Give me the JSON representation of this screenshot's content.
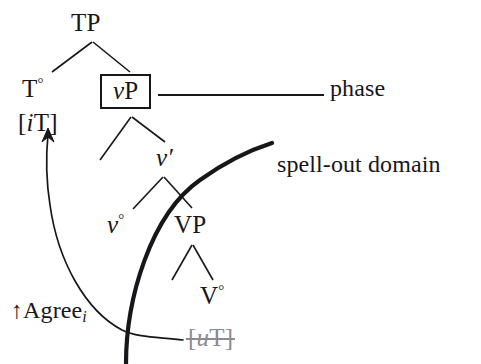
{
  "figure": {
    "background": "#ffffff",
    "ink": "#17161a",
    "trace_color": "#8b8b90"
  },
  "nodes": {
    "tp": "TP",
    "t_head": "T",
    "t_head_degree": "°",
    "it_open": "[",
    "it_feature_i": "i",
    "it_feature_T": "T",
    "it_close": "]",
    "vp_v": "v",
    "vp_P": "P",
    "vbar_v": "v",
    "vbar_prime": "′",
    "v_head": "v",
    "v_head_degree": "°",
    "VP": "VP",
    "V_head": "V",
    "V_head_degree": "°",
    "ut_open": "[",
    "ut_feature_u": "u",
    "ut_feature_T": "T",
    "ut_close": "]"
  },
  "annotations": {
    "phase": "phase",
    "spell_out_domain": "spell-out domain",
    "agree_arrow": "↑",
    "agree_label": "Agree",
    "agree_index": "i"
  },
  "partial_top_text": ""
}
